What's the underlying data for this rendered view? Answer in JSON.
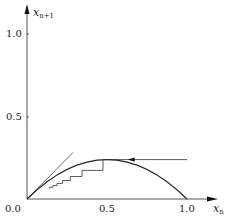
{
  "chart_data": {
    "type": "line",
    "title": "",
    "xlabel": "x_n",
    "ylabel": "x_{n+1}",
    "xlim": [
      0,
      1.1
    ],
    "ylim": [
      0,
      1.1
    ],
    "x_ticks": [
      "0.0",
      "0.5",
      "1.0"
    ],
    "y_ticks": [
      "0.0",
      "0.5",
      "1.0"
    ],
    "grid": false,
    "legend": null,
    "series": [
      {
        "name": "map curve",
        "kind": "parabola",
        "r": 0.95,
        "x": [
          0,
          0.1,
          0.2,
          0.3,
          0.4,
          0.5,
          0.6,
          0.7,
          0.8,
          0.9,
          1.0
        ],
        "values": [
          0,
          0.0855,
          0.152,
          0.1995,
          0.228,
          0.2375,
          0.228,
          0.1995,
          0.152,
          0.0855,
          0
        ]
      },
      {
        "name": "diagonal y = x",
        "x": [
          0,
          0.28
        ],
        "values": [
          0,
          0.28
        ]
      },
      {
        "name": "cobweb iterates",
        "x0": 0.5,
        "iterates": [
          0.5,
          0.2375,
          0.172,
          0.1353,
          0.1112,
          0.0939,
          0.0808,
          0.0706,
          0.0623
        ]
      }
    ],
    "annotations": [
      {
        "type": "arrow",
        "direction": "left",
        "x": 0.33,
        "y": 0.2375
      }
    ]
  },
  "labels": {
    "x_axis": "x",
    "x_axis_sub": "n",
    "y_axis": "x",
    "y_axis_sub": "n+1",
    "tick_x_0": "0.0",
    "tick_x_05": "0.5",
    "tick_x_1": "1.0",
    "tick_y_05": "0.5",
    "tick_y_1": "1.0"
  }
}
